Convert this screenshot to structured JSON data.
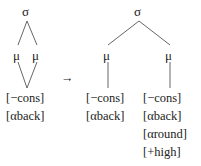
{
  "diagram": {
    "type": "autosegmental-syllable-structure",
    "arrow": "→",
    "left_tree": {
      "root": "σ",
      "moras": [
        "μ",
        "μ"
      ],
      "segment": [
        "[−cons]",
        "[αback]"
      ]
    },
    "right_tree": {
      "root": "σ",
      "moras": [
        "μ",
        "μ"
      ],
      "segment_1": [
        "[−cons]",
        "[αback]"
      ],
      "segment_2": [
        "[−cons]",
        "[αback]",
        "[αround]",
        "[+high]"
      ]
    },
    "colors": {
      "ink": "#222222",
      "lines": "#555555",
      "background": "#ffffff"
    }
  }
}
